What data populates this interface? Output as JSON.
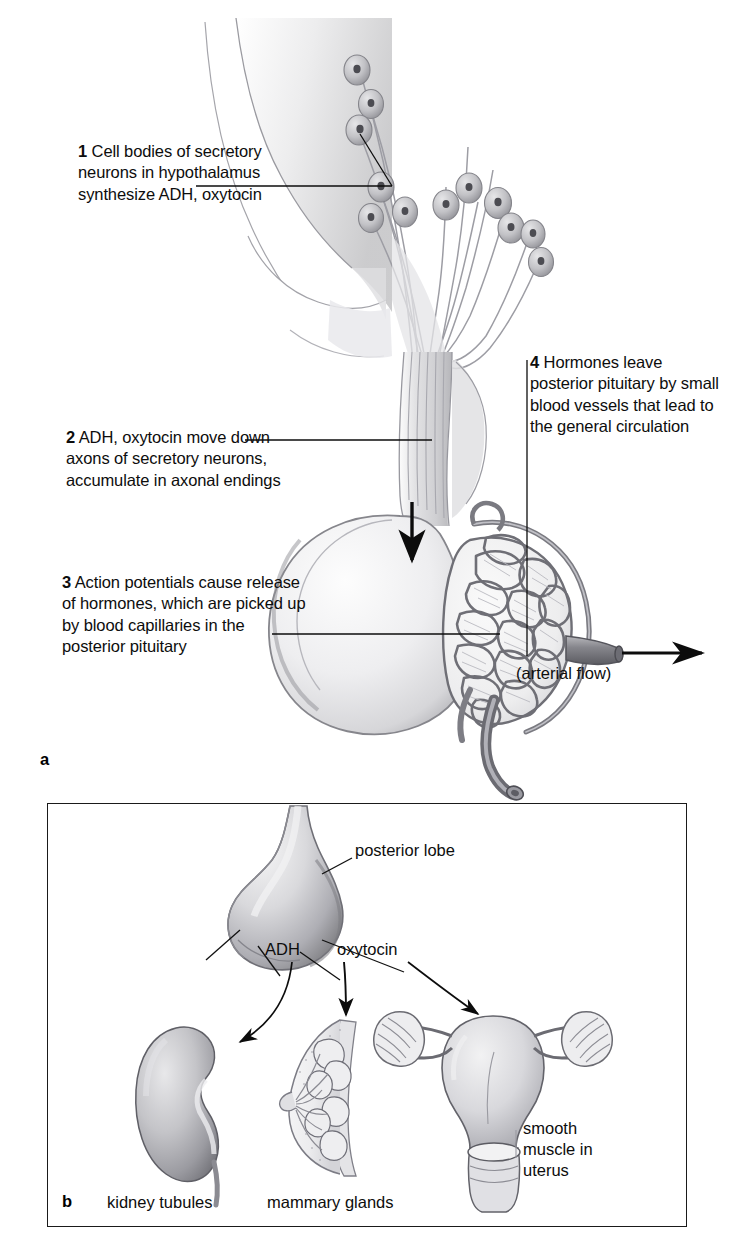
{
  "figure": {
    "background_color": "#ffffff",
    "ink_color": "#1a1a1a"
  },
  "panel_a": {
    "letter": "a",
    "callouts": [
      {
        "number": "1",
        "text": "Cell bodies of secretory neurons in hypothalamus synthesize ADH, oxytocin"
      },
      {
        "number": "2",
        "text": "ADH, oxytocin move down axons of secretory neurons, accumulate in axonal endings"
      },
      {
        "number": "3",
        "text": "Action potentials cause release of hormones, which are picked up by blood capillaries in the posterior pituitary"
      },
      {
        "number": "4",
        "text": "Hormones leave posterior pituitary by small blood vessels that lead to the general circulation"
      }
    ],
    "arterial_flow_label": "(arterial flow)"
  },
  "panel_b": {
    "letter": "b",
    "labels": {
      "posterior_lobe": "posterior lobe",
      "adh": "ADH",
      "oxytocin": "oxytocin",
      "kidney_tubules": "kidney tubules",
      "mammary_glands": "mammary glands",
      "smooth_muscle": "smooth muscle in uterus"
    }
  }
}
